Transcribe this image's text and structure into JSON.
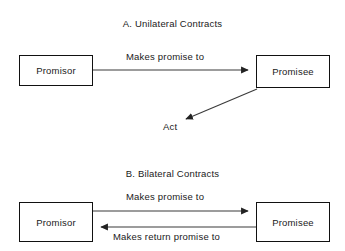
{
  "diagram": {
    "background": "#ffffff",
    "stroke_color": "#333333",
    "box_border_color": "#111111",
    "sections": [
      {
        "id": "unilateral",
        "title": "A. Unilateral Contracts",
        "nodes": {
          "promisor": "Promisor",
          "promisee": "Promisee",
          "act": "Act"
        },
        "edges": [
          {
            "label": "Makes promise to",
            "from": "Promisor",
            "to": "Promisee",
            "direction": "right"
          },
          {
            "label": "",
            "from": "Promisee",
            "to": "Act",
            "direction": "down-left"
          }
        ]
      },
      {
        "id": "bilateral",
        "title": "B. Bilateral Contracts",
        "nodes": {
          "promisor": "Promisor",
          "promisee": "Promisee"
        },
        "edges": [
          {
            "label": "Makes promise to",
            "from": "Promisor",
            "to": "Promisee",
            "direction": "right"
          },
          {
            "label": "Makes return promise to",
            "from": "Promisee",
            "to": "Promisor",
            "direction": "left"
          }
        ]
      }
    ]
  }
}
